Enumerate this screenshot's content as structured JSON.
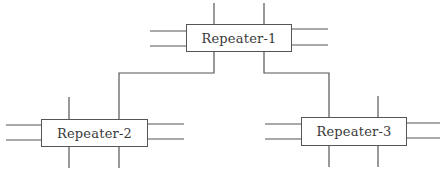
{
  "diagram": {
    "type": "network-topology",
    "line_color": "#555555",
    "nodes": [
      {
        "id": "r1",
        "label": "Repeater-1",
        "x": 186,
        "y": 24,
        "w": 106,
        "h": 28
      },
      {
        "id": "r2",
        "label": "Repeater-2",
        "x": 41,
        "y": 119,
        "w": 107,
        "h": 28
      },
      {
        "id": "r3",
        "label": "Repeater-3",
        "x": 301,
        "y": 117,
        "w": 106,
        "h": 29
      }
    ],
    "edges": [
      {
        "from": "r1",
        "to": "r2"
      },
      {
        "from": "r1",
        "to": "r3"
      }
    ]
  }
}
